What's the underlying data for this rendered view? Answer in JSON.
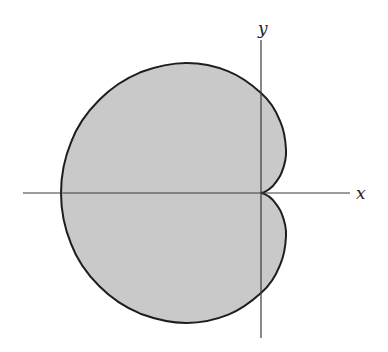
{
  "diagram": {
    "type": "polar-curve",
    "curve": "cardioid",
    "equation": "r = a(1 - cos θ)",
    "fill_color": "#c9c9c9",
    "stroke_color": "#1e1e1e",
    "axes": {
      "x_label": "x",
      "y_label": "y"
    },
    "features": {
      "cusp_at_origin": true,
      "opens_to": "left",
      "leftmost_x_in_units_of_a": -2,
      "max_y_in_units_of_a": 1.299
    }
  }
}
